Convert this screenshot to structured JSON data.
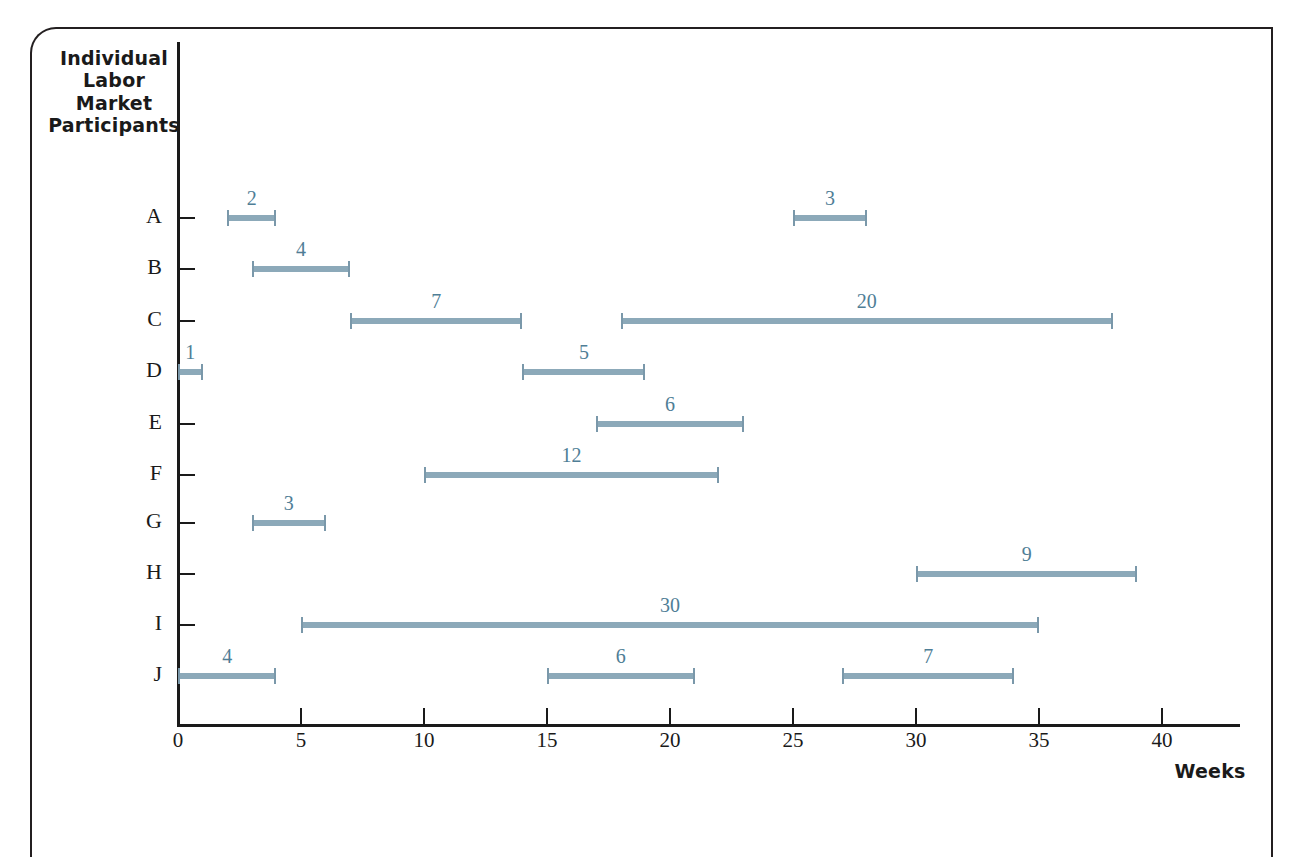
{
  "frame": {
    "border_color": "#231f20"
  },
  "chart_data": {
    "type": "bar",
    "chart_kind": "horizontal-spell-gantt",
    "title": "",
    "ylabel": "Individual Labor Market Participants",
    "xlabel": "Weeks",
    "xlim": [
      0,
      43.5
    ],
    "xticks": [
      0,
      5,
      10,
      15,
      20,
      25,
      30,
      35,
      40
    ],
    "xtick_labels": [
      "0",
      "5",
      "10",
      "15",
      "20",
      "25",
      "30",
      "35",
      "40"
    ],
    "grid": false,
    "legend": "none",
    "bar_color": "#8ca9b9",
    "label_color": "#4f7e96",
    "categories": [
      "A",
      "B",
      "C",
      "D",
      "E",
      "F",
      "G",
      "H",
      "I",
      "J"
    ],
    "series": [
      {
        "name": "A",
        "spells": [
          {
            "start": 2,
            "end": 4,
            "duration": 2,
            "label": "2"
          },
          {
            "start": 25,
            "end": 28,
            "duration": 3,
            "label": "3"
          }
        ]
      },
      {
        "name": "B",
        "spells": [
          {
            "start": 3,
            "end": 7,
            "duration": 4,
            "label": "4"
          }
        ]
      },
      {
        "name": "C",
        "spells": [
          {
            "start": 7,
            "end": 14,
            "duration": 7,
            "label": "7"
          },
          {
            "start": 18,
            "end": 38,
            "duration": 20,
            "label": "20"
          }
        ]
      },
      {
        "name": "D",
        "spells": [
          {
            "start": 0,
            "end": 1,
            "duration": 1,
            "label": "1"
          },
          {
            "start": 14,
            "end": 19,
            "duration": 5,
            "label": "5"
          }
        ]
      },
      {
        "name": "E",
        "spells": [
          {
            "start": 17,
            "end": 23,
            "duration": 6,
            "label": "6"
          }
        ]
      },
      {
        "name": "F",
        "spells": [
          {
            "start": 10,
            "end": 22,
            "duration": 12,
            "label": "12"
          }
        ]
      },
      {
        "name": "G",
        "spells": [
          {
            "start": 3,
            "end": 6,
            "duration": 3,
            "label": "3"
          }
        ]
      },
      {
        "name": "H",
        "spells": [
          {
            "start": 30,
            "end": 39,
            "duration": 9,
            "label": "9"
          }
        ]
      },
      {
        "name": "I",
        "spells": [
          {
            "start": 5,
            "end": 35,
            "duration": 30,
            "label": "30"
          }
        ]
      },
      {
        "name": "J",
        "spells": [
          {
            "start": 0,
            "end": 4,
            "duration": 4,
            "label": "4"
          },
          {
            "start": 15,
            "end": 21,
            "duration": 6,
            "label": "6"
          },
          {
            "start": 27,
            "end": 34,
            "duration": 7,
            "label": "7"
          }
        ]
      }
    ]
  },
  "y_axis": {
    "title_lines": [
      "Individual",
      "Labor",
      "Market",
      "Participants"
    ],
    "title_text": "Individual Labor Market Participants"
  },
  "x_axis": {
    "title_text": "Weeks"
  }
}
